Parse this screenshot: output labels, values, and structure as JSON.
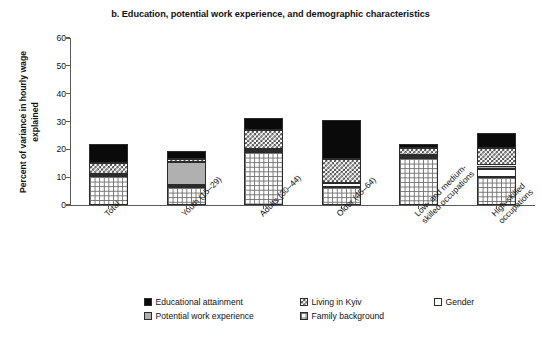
{
  "chart_data": {
    "type": "bar",
    "stacked": true,
    "title": "b. Education, potential work experience, and demographic characteristics",
    "xlabel": "",
    "ylabel": "Percent of variance in hourly wage explained",
    "ylim": [
      0,
      60
    ],
    "yticks": [
      0,
      10,
      20,
      30,
      40,
      50,
      60
    ],
    "grid": false,
    "legend_position": "bottom",
    "categories": [
      "Total",
      "Youth (15–29)",
      "Adults (30–44)",
      "Older (45–64)",
      "Low- and medium-\nskilled occupations",
      "High-skilled\noccupations"
    ],
    "series": [
      {
        "name": "Family background",
        "pattern": "grid",
        "color": "#ffffff",
        "values": [
          10.3,
          6.5,
          19.0,
          6.5,
          17.0,
          10.0
        ]
      },
      {
        "name": "Gender",
        "pattern": "solid-white",
        "color": "#ffffff",
        "values": [
          0.7,
          0.6,
          0.3,
          1.3,
          0.4,
          3.0
        ]
      },
      {
        "name": "Potential work experience",
        "pattern": "solid-gray",
        "color": "#b0b0b0",
        "values": [
          0.0,
          8.5,
          0.8,
          0.0,
          0.6,
          1.2
        ]
      },
      {
        "name": "Living in Kyiv",
        "pattern": "checker",
        "color": "#4a4a4a",
        "values": [
          4.0,
          0.9,
          7.0,
          8.7,
          2.5,
          6.2
        ]
      },
      {
        "name": "Educational attainment",
        "pattern": "solid-black",
        "color": "#0a0a0a",
        "values": [
          7.0,
          3.0,
          4.2,
          14.0,
          1.5,
          5.6
        ]
      }
    ],
    "totals": [
      22.0,
      19.5,
      31.3,
      30.5,
      22.0,
      26.0
    ]
  },
  "legend": {
    "items": [
      {
        "label": "Educational attainment",
        "pattern": "solid-black"
      },
      {
        "label": "Living in Kyiv",
        "pattern": "checker"
      },
      {
        "label": "Gender",
        "pattern": "solid-white"
      },
      {
        "label": "Potential work experience",
        "pattern": "solid-gray"
      },
      {
        "label": "Family background",
        "pattern": "grid"
      }
    ]
  }
}
